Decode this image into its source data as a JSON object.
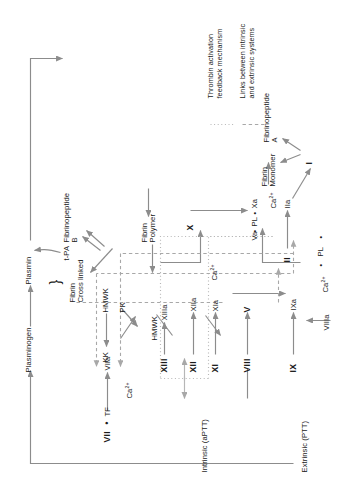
{
  "diagram": {
    "type": "flow-diagram",
    "orientation": "rotated-90",
    "line_color": "#8c8c8c",
    "text_color": "#1a1a1a",
    "dotted_color": "#b0b0b0",
    "dashed_color": "#9a9a9a"
  },
  "pathway_labels": {
    "intrinsic": "Intrinsic (aPTT)",
    "extrinsic": "Extrinsic (PTT)"
  },
  "nodes": {
    "hmwk_top": "HMWK",
    "pk": "PK",
    "kk": "KK",
    "f12": "XII",
    "f12a": "XIIa",
    "f11": "XI",
    "f11a": "XIa",
    "hmwk_mid": "HMWK",
    "ca_11": "Ca",
    "ca_11_sup": "2+",
    "f9": "IX",
    "f9a": "IXa",
    "complex_tenase_ca": "Ca",
    "complex_tenase_ca_sup": "2+",
    "complex_tenase_dot1": "•",
    "complex_tenase_pl": "PL",
    "complex_tenase_dot2": "•",
    "complex_tenase_8a": "VIIIa",
    "f8": "VIII",
    "f5": "V",
    "f5a": "Va",
    "f10": "X",
    "f10a": "Xa",
    "complex_pro_dot1": "•",
    "complex_pro_pl": "PL",
    "complex_pro_dot2": "•",
    "complex_pro_ca": "Ca",
    "complex_pro_ca_sup": "2+",
    "f7": "VII",
    "f7_dot": "•",
    "tf": "TF",
    "f7a": "VIIa",
    "ca_7": "Ca",
    "ca_7_sup": "2+",
    "f2": "II",
    "f2a": "IIa",
    "f1": "I",
    "f13": "XIII",
    "f13a": "XIIIa",
    "fibrin_monomer": "Fibrin\nMonomer",
    "fibrinopeptide_a": "Fibrinopeptide\nA",
    "fibrin_polymer": "Fibrin\nPolymer",
    "fibrin_cross_linked": "Fibrin\nCross linked",
    "fibrinopeptide_b": "Fibrinopeptide\nB",
    "plasminogen": "Plasminogen",
    "plasmin": "Plasmin",
    "tpa": "t-PA",
    "brace": "}"
  },
  "legend": {
    "items": [
      {
        "text": "Thrombin activation\nfeedback mechanism",
        "style": "dotted"
      },
      {
        "text": "Links between intrinsic\nand extrinsic systems",
        "style": "dashed"
      }
    ]
  }
}
